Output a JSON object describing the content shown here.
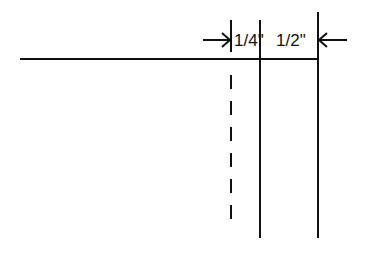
{
  "diagram": {
    "labels": {
      "quarter": "1/4\"",
      "half": "1/2\""
    },
    "colors": {
      "line": "#111111",
      "background": "#ffffff"
    }
  }
}
